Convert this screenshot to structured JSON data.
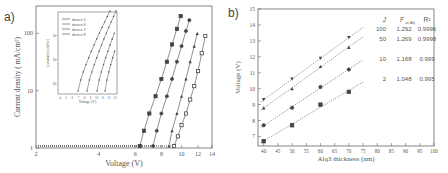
{
  "panels": {
    "a": {
      "label": "a)"
    },
    "b": {
      "label": "b)"
    }
  },
  "chart_data": [
    {
      "type": "scatter",
      "panel": "a",
      "title": "",
      "xlabel": "Voltage (V)",
      "ylabel": "Current density ( mA/cm²)",
      "xscale": "log",
      "yscale": "log",
      "xlim": [
        2,
        14
      ],
      "ylim": [
        1,
        300
      ],
      "x_ticks": [
        "2",
        "4",
        "6",
        "8",
        "10",
        "12",
        "14"
      ],
      "y_ticks": [
        "1",
        "10",
        "100"
      ],
      "series": [
        {
          "name": "filled squares",
          "marker": "square-filled",
          "x": [
            6.3,
            6.6,
            7.0,
            7.5,
            8.0,
            8.5,
            9.0,
            9.5,
            9.9
          ],
          "y": [
            1,
            2,
            4,
            8,
            16,
            32,
            64,
            120,
            200
          ]
        },
        {
          "name": "filled circles",
          "marker": "circle-filled",
          "x": [
            7.3,
            7.6,
            8.0,
            8.5,
            9.0,
            9.5,
            10.0,
            10.5,
            10.9
          ],
          "y": [
            1,
            2,
            4,
            8,
            16,
            32,
            60,
            110,
            170
          ]
        },
        {
          "name": "filled triangles",
          "marker": "triangle-filled",
          "x": [
            8.7,
            9.0,
            9.5,
            10.0,
            10.5,
            11.0,
            11.5,
            11.9
          ],
          "y": [
            1,
            2,
            4,
            8,
            16,
            32,
            60,
            100
          ]
        },
        {
          "name": "open squares",
          "marker": "square-open",
          "x": [
            9.2,
            9.6,
            10.0,
            10.5,
            11.0,
            11.5,
            12.0,
            12.5,
            13.0
          ],
          "y": [
            1,
            1.6,
            2.5,
            4,
            7,
            12,
            22,
            45,
            90
          ]
        }
      ],
      "inset": {
        "type": "line",
        "xlabel": "Voltage (V)",
        "ylabel": "Luminance (cd/m²)",
        "legend": [
          "device 5",
          "device 6",
          "device 7",
          "device 8"
        ],
        "y_ticks": [
          "10³",
          "10²",
          "10¹"
        ],
        "x_ticks": [
          "4",
          "5",
          "6",
          "7",
          "8",
          "9",
          "10",
          "11",
          "12",
          "13"
        ]
      }
    },
    {
      "type": "scatter",
      "panel": "b",
      "title": "",
      "xlabel": "Alq3 thickness (nm)",
      "ylabel": "Voltage (V)",
      "xlim": [
        38,
        100
      ],
      "ylim": [
        6.4,
        15
      ],
      "x_ticks": [
        "40",
        "45",
        "50",
        "55",
        "60",
        "65",
        "70",
        "75",
        "80",
        "85",
        "90",
        "95",
        "100"
      ],
      "y_ticks": [
        "7",
        "8",
        "9",
        "10",
        "11",
        "12",
        "13",
        "14",
        "15"
      ],
      "categories": [
        40,
        50,
        60,
        70
      ],
      "series": [
        {
          "name": "J=100",
          "marker": "triangle-down",
          "values": [
            9.3,
            10.6,
            11.9,
            13.2
          ],
          "F": "1.292",
          "R2": "0.9996"
        },
        {
          "name": "J=50",
          "marker": "triangle-up",
          "values": [
            8.8,
            10.0,
            11.4,
            12.6
          ],
          "F": "1.269",
          "R2": "0.9998"
        },
        {
          "name": "J=10",
          "marker": "circle",
          "values": [
            7.7,
            8.8,
            10.1,
            11.2
          ],
          "F": "1.168",
          "R2": "0.999"
        },
        {
          "name": "J=2",
          "marker": "square",
          "values": [
            6.7,
            7.7,
            9.0,
            9.8
          ],
          "F": "1.048",
          "R2": "0.995"
        }
      ],
      "table": {
        "headers": [
          "J",
          "F_av, Alq",
          "R²"
        ],
        "rows": [
          [
            "100",
            "1.292",
            "0.9996"
          ],
          [
            "50",
            "1.269",
            "0.9998"
          ],
          [
            "10",
            "1.168",
            "0.999"
          ],
          [
            "2",
            "1.048",
            "0.995"
          ]
        ]
      },
      "fit_lines": "dotted"
    }
  ]
}
